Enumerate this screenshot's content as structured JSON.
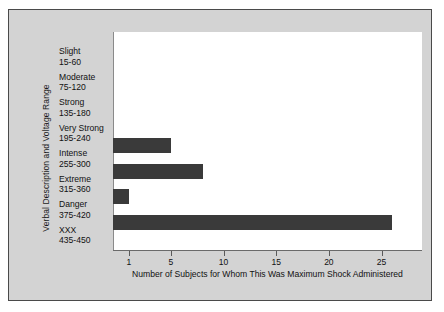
{
  "chart_data": {
    "type": "bar",
    "orientation": "horizontal",
    "title": "",
    "xlabel": "Number of Subjects for Whom This Was Maximum Shock Administered",
    "ylabel": "Verbal Description and Voltage Range",
    "categories": [
      "Slight",
      "Moderate",
      "Strong",
      "Very Strong",
      "Intense",
      "Extreme",
      "Danger",
      "XXX"
    ],
    "category_ranges": [
      "15-60",
      "75-120",
      "135-180",
      "195-240",
      "255-300",
      "315-360",
      "375-420",
      "435-450"
    ],
    "values": [
      0,
      0,
      0,
      0,
      5,
      8,
      1,
      26
    ],
    "xticks": [
      1,
      5,
      10,
      15,
      20,
      25
    ],
    "xticklabels": [
      "1",
      "5",
      "10",
      "15",
      "20",
      "25"
    ],
    "xlim": [
      0,
      30
    ],
    "grid": false,
    "legend": null,
    "bar_color": "#3a3a3a",
    "plot_background": "#ffffff",
    "figure_background": "#d3d3d3",
    "frame_color": "#4a4a4a"
  },
  "axes": {
    "y_title": "Verbal Description and Voltage Range",
    "x_title": "Number of Subjects for Whom This Was Maximum Shock Administered"
  },
  "categories": [
    {
      "name": "Slight",
      "range": "15-60",
      "value": 0
    },
    {
      "name": "Moderate",
      "range": "75-120",
      "value": 0
    },
    {
      "name": "Strong",
      "range": "135-180",
      "value": 0
    },
    {
      "name": "Very Strong",
      "range": "195-240",
      "value": 0
    },
    {
      "name": "Intense",
      "range": "255-300",
      "value": 5
    },
    {
      "name": "Extreme",
      "range": "315-360",
      "value": 8
    },
    {
      "name": "Danger",
      "range": "375-420",
      "value": 1
    },
    {
      "name": "XXX",
      "range": "435-450",
      "value": 26
    }
  ],
  "xticks": [
    {
      "value": 1,
      "label": "1"
    },
    {
      "value": 5,
      "label": "5"
    },
    {
      "value": 10,
      "label": "10"
    },
    {
      "value": 15,
      "label": "15"
    },
    {
      "value": 20,
      "label": "20"
    },
    {
      "value": 25,
      "label": "25"
    }
  ]
}
